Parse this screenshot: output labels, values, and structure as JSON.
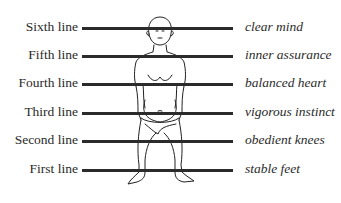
{
  "diagram": {
    "lines": [
      {
        "name": "Sixth line",
        "meaning": "clear mind"
      },
      {
        "name": "Fifth line",
        "meaning": "inner assurance"
      },
      {
        "name": "Fourth line",
        "meaning": "balanced heart"
      },
      {
        "name": "Third line",
        "meaning": "vigorous instinct"
      },
      {
        "name": "Second line",
        "meaning": "obedient knees"
      },
      {
        "name": "First line",
        "meaning": "stable feet"
      }
    ],
    "figure": "standing-human-figure",
    "line_color": "#2b2b2b"
  }
}
